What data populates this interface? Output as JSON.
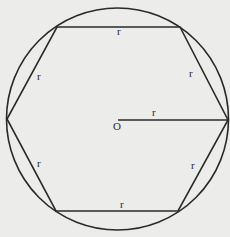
{
  "diagram": {
    "colors": {
      "background": "#ececea",
      "stroke": "#2a2a2a"
    },
    "circle": {
      "cx": 117.5,
      "cy": 119,
      "r": 111
    },
    "hexagon_vertices": [
      [
        57,
        27
      ],
      [
        180,
        27
      ],
      [
        228,
        120
      ],
      [
        178,
        211
      ],
      [
        56,
        211
      ],
      [
        7,
        119
      ]
    ],
    "radius_line": {
      "x1": 118,
      "y1": 120,
      "x2": 228,
      "y2": 120
    },
    "labels": {
      "center": "O",
      "side_top": "r",
      "side_upper_right": "r",
      "side_lower_right": "r",
      "side_bottom": "r",
      "side_lower_left": "r",
      "side_upper_left": "r",
      "radius": "r"
    }
  }
}
